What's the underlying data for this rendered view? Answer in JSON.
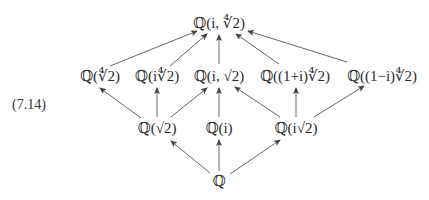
{
  "equation_label": "(7.14)",
  "nodes": {
    "top": {
      "label": "ℚ(i, ∜2)",
      "x": 219,
      "y": 23
    },
    "q4rt2": {
      "label": "ℚ(∜2)",
      "x": 100,
      "y": 76
    },
    "qi4rt2": {
      "label": "ℚ(i∜2)",
      "x": 157,
      "y": 76
    },
    "qisqrt2c": {
      "label": "ℚ(i, √2)",
      "x": 219,
      "y": 76
    },
    "q1pi": {
      "label": "ℚ((1+i)∜2)",
      "x": 295,
      "y": 76
    },
    "q1mi": {
      "label": "ℚ((1−i)∜2)",
      "x": 382,
      "y": 76
    },
    "qsqrt2": {
      "label": "ℚ(√2)",
      "x": 157,
      "y": 128
    },
    "qi": {
      "label": "ℚ(i)",
      "x": 219,
      "y": 128
    },
    "qisqrt2": {
      "label": "ℚ(i√2)",
      "x": 296,
      "y": 128
    },
    "bottom": {
      "label": "ℚ",
      "x": 219,
      "y": 181
    }
  },
  "edges": [
    {
      "from": "q4rt2",
      "to": "top",
      "x1": 110,
      "y1": 66,
      "x2": 197,
      "y2": 31
    },
    {
      "from": "qi4rt2",
      "to": "top",
      "x1": 170,
      "y1": 66,
      "x2": 207,
      "y2": 34
    },
    {
      "from": "qisqrt2c",
      "to": "top",
      "x1": 219,
      "y1": 64,
      "x2": 219,
      "y2": 35
    },
    {
      "from": "q1pi",
      "to": "top",
      "x1": 279,
      "y1": 64,
      "x2": 236,
      "y2": 34
    },
    {
      "from": "q1mi",
      "to": "top",
      "x1": 347,
      "y1": 62,
      "x2": 248,
      "y2": 31
    },
    {
      "from": "qsqrt2",
      "to": "q4rt2",
      "x1": 141,
      "y1": 118,
      "x2": 100,
      "y2": 88
    },
    {
      "from": "qsqrt2",
      "to": "qi4rt2",
      "x1": 157,
      "y1": 117,
      "x2": 157,
      "y2": 88
    },
    {
      "from": "qsqrt2",
      "to": "qisqrt2c",
      "x1": 171,
      "y1": 117,
      "x2": 207,
      "y2": 88
    },
    {
      "from": "qi",
      "to": "qisqrt2c",
      "x1": 219,
      "y1": 117,
      "x2": 219,
      "y2": 88
    },
    {
      "from": "qisqrt2",
      "to": "qisqrt2c",
      "x1": 280,
      "y1": 117,
      "x2": 235,
      "y2": 87
    },
    {
      "from": "qisqrt2",
      "to": "q1pi",
      "x1": 296,
      "y1": 117,
      "x2": 296,
      "y2": 88
    },
    {
      "from": "qisqrt2",
      "to": "q1mi",
      "x1": 314,
      "y1": 117,
      "x2": 364,
      "y2": 86
    },
    {
      "from": "bottom",
      "to": "qsqrt2",
      "x1": 210,
      "y1": 173,
      "x2": 171,
      "y2": 141
    },
    {
      "from": "bottom",
      "to": "qi",
      "x1": 219,
      "y1": 171,
      "x2": 219,
      "y2": 140
    },
    {
      "from": "bottom",
      "to": "qisqrt2",
      "x1": 230,
      "y1": 174,
      "x2": 280,
      "y2": 140
    }
  ]
}
